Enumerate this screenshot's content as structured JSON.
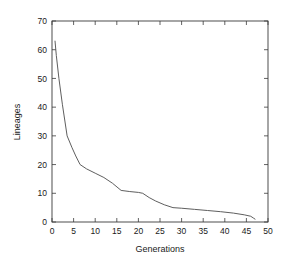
{
  "chart_data": {
    "type": "line",
    "title": "",
    "xlabel": "Generations",
    "ylabel": "Lineages",
    "xlim": [
      0,
      50
    ],
    "ylim": [
      0,
      70
    ],
    "xticks": [
      0,
      5,
      10,
      15,
      20,
      25,
      30,
      35,
      40,
      45,
      50
    ],
    "xtick_labels": [
      "0",
      "5",
      "10",
      "15",
      "20",
      "25",
      "30",
      "35",
      "40",
      "45",
      "50"
    ],
    "yticks": [
      0,
      10,
      20,
      30,
      40,
      50,
      60,
      70
    ],
    "ytick_labels": [
      "0",
      "10",
      "20",
      "30",
      "40",
      "50",
      "60",
      "70"
    ],
    "grid": false,
    "legend": false,
    "frame": "box",
    "tick_direction": "in",
    "line_color": "#555555",
    "series": [
      {
        "name": "lineages",
        "x": [
          0.7,
          1.0,
          1.6,
          2.4,
          3.5,
          4.6,
          5.5,
          6.5,
          8.0,
          10.0,
          12.0,
          14.0,
          16.0,
          18.0,
          20.0,
          21.0,
          22.5,
          24.0,
          26.0,
          28.0,
          30.0,
          33.0,
          36.0,
          39.0,
          42.0,
          44.5,
          46.0,
          46.6,
          47.0
        ],
        "y": [
          63,
          58,
          50,
          41,
          30,
          26,
          23,
          20,
          18.5,
          17,
          15.5,
          13.5,
          11,
          10.6,
          10.3,
          10,
          8.5,
          7.3,
          6,
          5,
          4.8,
          4.4,
          4.0,
          3.6,
          3.1,
          2.5,
          2.0,
          1.4,
          1.0
        ]
      }
    ]
  }
}
